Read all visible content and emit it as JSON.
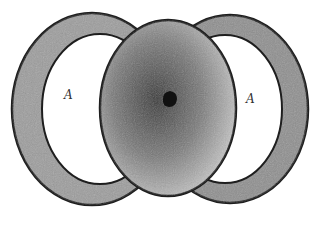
{
  "figure": {
    "type": "scanned-illustration",
    "labels": {
      "left": "A",
      "right": "A"
    },
    "colors": {
      "background": "#ffffff",
      "ring_fill": "#9a9a9a",
      "center_fill": "#6e6e6e",
      "outline": "#1e1e1e",
      "nucleus": "#111111"
    }
  }
}
